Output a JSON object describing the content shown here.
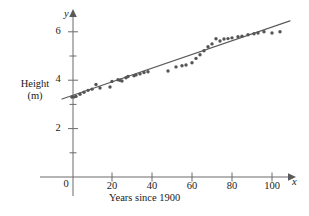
{
  "figure": {
    "kind": "scatter-with-trendline",
    "background": "#ffffff",
    "ink_color": "#3a3a3a",
    "point_color": "#555555",
    "line_color": "#555555"
  },
  "axes": {
    "y_variable_symbol": "y",
    "x_variable_symbol": "x",
    "y_title_line1": "Height",
    "y_title_line2": "(m)",
    "x_title": "Years since 1900",
    "origin_label": "0",
    "y_tick_labels": [
      "6",
      "4",
      "2"
    ],
    "y_tick_values": [
      6,
      4,
      2
    ],
    "y_minor_tick_values": [
      1,
      3,
      5
    ],
    "x_tick_labels": [
      "20",
      "40",
      "60",
      "80",
      "100"
    ],
    "x_tick_values": [
      20,
      40,
      60,
      80,
      100
    ]
  },
  "chart_data": {
    "type": "scatter",
    "title": "",
    "xlabel": "Years since 1900",
    "ylabel": "Height (m)",
    "xlim": [
      -7,
      118
    ],
    "ylim": [
      0,
      7
    ],
    "grid": false,
    "legend": null,
    "x_ticks": [
      0,
      20,
      40,
      60,
      80,
      100
    ],
    "y_ticks": [
      0,
      2,
      4,
      6
    ],
    "y_minor_ticks": [
      1,
      3,
      5
    ],
    "series": [
      {
        "name": "Record height",
        "marker": "filled-circle",
        "points": [
          [
            0,
            3.3
          ],
          [
            1,
            3.31
          ],
          [
            2,
            3.33
          ],
          [
            4,
            3.42
          ],
          [
            6,
            3.5
          ],
          [
            8,
            3.58
          ],
          [
            10,
            3.63
          ],
          [
            12,
            3.82
          ],
          [
            14,
            3.68
          ],
          [
            19,
            3.72
          ],
          [
            20,
            3.95
          ],
          [
            23,
            4.02
          ],
          [
            24,
            4.0
          ],
          [
            25,
            3.97
          ],
          [
            27,
            4.1
          ],
          [
            28,
            4.15
          ],
          [
            31,
            4.18
          ],
          [
            32,
            4.22
          ],
          [
            34,
            4.26
          ],
          [
            36,
            4.32
          ],
          [
            38,
            4.35
          ],
          [
            48,
            4.38
          ],
          [
            52,
            4.55
          ],
          [
            55,
            4.6
          ],
          [
            57,
            4.63
          ],
          [
            60,
            4.72
          ],
          [
            62,
            4.9
          ],
          [
            64,
            5.05
          ],
          [
            66,
            5.22
          ],
          [
            68,
            5.38
          ],
          [
            70,
            5.5
          ],
          [
            72,
            5.71
          ],
          [
            74,
            5.62
          ],
          [
            76,
            5.7
          ],
          [
            78,
            5.72
          ],
          [
            80,
            5.75
          ],
          [
            83,
            5.8
          ],
          [
            85,
            5.82
          ],
          [
            88,
            5.88
          ],
          [
            91,
            5.92
          ],
          [
            93,
            5.95
          ],
          [
            96,
            6.0
          ],
          [
            100,
            5.95
          ],
          [
            104,
            6.0
          ]
        ]
      }
    ],
    "trendline": {
      "name": "line of best fit",
      "x_start": -5,
      "y_start": 3.22,
      "x_end": 109,
      "y_end": 6.45,
      "slope": 0.0283,
      "intercept": 3.36
    }
  }
}
